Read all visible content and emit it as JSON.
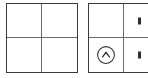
{
  "canvas": {
    "width": 148,
    "height": 78,
    "background": "#ffffff",
    "border_color": "#3a3a3a",
    "gridline_color": "#6b6b6b"
  },
  "panels": [
    {
      "id": "left",
      "name": "left-grid-panel",
      "rows": 2,
      "columns": 2,
      "cells": [
        {
          "name": "left-cell-r1c1",
          "text": ""
        },
        {
          "name": "left-cell-r1c2",
          "text": ""
        },
        {
          "name": "left-cell-r2c1",
          "text": ""
        },
        {
          "name": "left-cell-r2c2",
          "text": ""
        }
      ]
    },
    {
      "id": "right",
      "name": "right-grid-panel",
      "rows": 2,
      "columns": 2,
      "clipped": true,
      "cells": [
        {
          "name": "right-cell-r1c1",
          "text": ""
        },
        {
          "name": "right-cell-r1c2",
          "text": "",
          "glyph": "clipped-mark"
        },
        {
          "name": "right-cell-r2c1",
          "text": "",
          "icon": "circle-chevron-up-icon"
        },
        {
          "name": "right-cell-r2c2",
          "text": "",
          "glyph": "clipped-mark"
        }
      ]
    }
  ],
  "icons": {
    "circle_chevron_up": {
      "name": "circle-chevron-up-icon",
      "stroke": "#2e2e2e",
      "diameter": 19
    }
  }
}
